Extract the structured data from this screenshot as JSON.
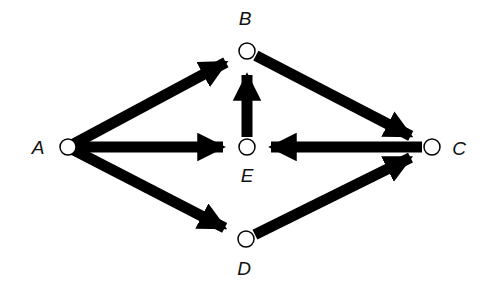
{
  "diagram": {
    "type": "directed-flow-network",
    "colors": {
      "edge": "#000000",
      "node_fill": "#ffffff",
      "node_stroke": "#000000",
      "background": "#ffffff"
    },
    "nodes": [
      {
        "id": "A",
        "label": "A",
        "x": 68,
        "y": 147,
        "label_x": 38,
        "label_y": 154
      },
      {
        "id": "B",
        "label": "B",
        "x": 247,
        "y": 51,
        "label_x": 245,
        "label_y": 25
      },
      {
        "id": "E",
        "label": "E",
        "x": 247,
        "y": 147,
        "label_x": 247,
        "label_y": 182
      },
      {
        "id": "C",
        "label": "C",
        "x": 432,
        "y": 147,
        "label_x": 459,
        "label_y": 155
      },
      {
        "id": "D",
        "label": "D",
        "x": 246,
        "y": 239,
        "label_x": 244,
        "label_y": 275
      }
    ],
    "edges": [
      {
        "from": "A",
        "to": "B"
      },
      {
        "from": "A",
        "to": "E"
      },
      {
        "from": "A",
        "to": "D"
      },
      {
        "from": "E",
        "to": "B"
      },
      {
        "from": "C",
        "to": "E"
      },
      {
        "from": "B",
        "to": "C"
      },
      {
        "from": "D",
        "to": "C"
      }
    ]
  }
}
